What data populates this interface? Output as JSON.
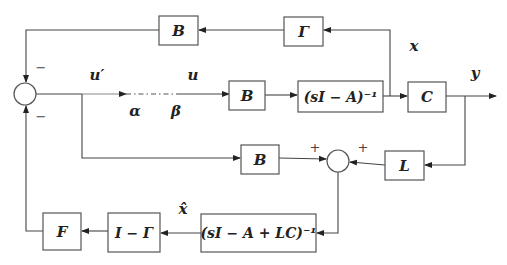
{
  "diagram": {
    "type": "control-system block diagram (observer-based state feedback)",
    "blocks": {
      "top_B": "B",
      "gamma": "Γ",
      "mid_B": "B",
      "plant": "(sI − A)⁻¹",
      "output_C": "C",
      "obs_B": "B",
      "obs_L": "L",
      "observer": "(sI − A + LC)⁻¹",
      "one_minus_gamma": "I − Γ",
      "gain_F": "F"
    },
    "signals": {
      "u_prime": "u′",
      "u": "u",
      "alpha": "α",
      "beta": "β",
      "x": "x",
      "y": "y",
      "x_hat": "x̂"
    },
    "junctions": {
      "main_sum": {
        "top_sign": "−",
        "bottom_sign": "−"
      },
      "observer_sum": {
        "left_sign": "+",
        "right_sign": "+"
      }
    }
  }
}
